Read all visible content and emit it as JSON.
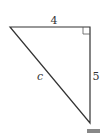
{
  "diagram": {
    "type": "right-triangle",
    "sides": {
      "top": "4",
      "right": "5",
      "hypotenuse": "c"
    },
    "right_angle_at": "top-right",
    "colors": {
      "stroke": "#333333",
      "marker": "#888888"
    }
  }
}
